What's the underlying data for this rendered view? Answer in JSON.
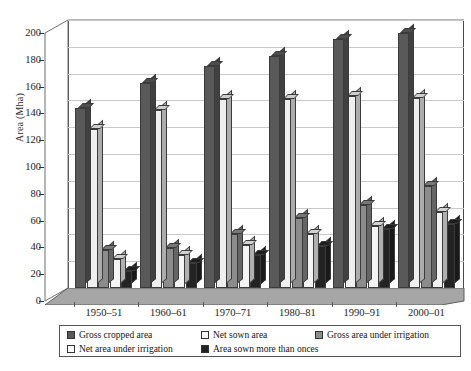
{
  "chart_data": {
    "type": "bar",
    "title": "",
    "xlabel": "",
    "ylabel": "Area (Mha)",
    "categories": [
      "1950–51",
      "1960–61",
      "1970–71",
      "1980–81",
      "1990–91",
      "2000–01"
    ],
    "ylim": [
      0,
      200
    ],
    "yticks": [
      0,
      20,
      40,
      60,
      80,
      100,
      120,
      140,
      160,
      180,
      200
    ],
    "grid": true,
    "legend_position": "bottom",
    "three_d": true,
    "series": [
      {
        "name": "Gross cropped area",
        "color": "#595959",
        "values": [
          134,
          153,
          166,
          173,
          186,
          190
        ]
      },
      {
        "name": "Net sown area",
        "color": "#efefef",
        "values": [
          119,
          133,
          141,
          141,
          143,
          142
        ]
      },
      {
        "name": "Gross area under irrigation",
        "color": "#8c8c8c",
        "values": [
          28,
          30,
          40,
          52,
          62,
          76
        ]
      },
      {
        "name": "Net area under irrigation",
        "color": "#f4f4f4",
        "values": [
          22,
          25,
          32,
          40,
          46,
          57
        ]
      },
      {
        "name": "Area sown more than onces",
        "color": "#232323",
        "values": [
          13,
          19,
          25,
          31,
          44,
          48
        ]
      }
    ]
  },
  "legend": {
    "items": [
      {
        "label": "Gross cropped area",
        "color": "#595959"
      },
      {
        "label": "Net sown area",
        "color": "#efefef"
      },
      {
        "label": "Gross area under irrigation",
        "color": "#8c8c8c"
      },
      {
        "label": "Net area under irrigation",
        "color": "#f4f4f4"
      },
      {
        "label": "Area sown more than onces",
        "color": "#232323"
      }
    ]
  }
}
